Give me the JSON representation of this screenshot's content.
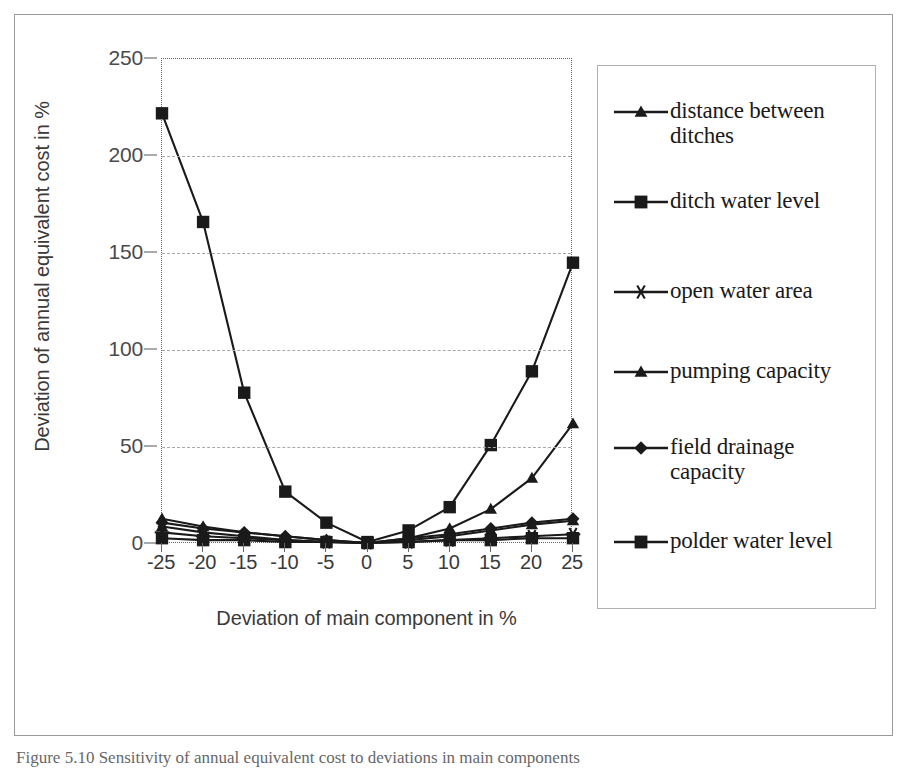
{
  "chart_data": {
    "type": "line",
    "title": "",
    "xlabel": "Deviation of main component in %",
    "ylabel": "Deviation of annual equivalent cost in %",
    "x": [
      -25,
      -20,
      -15,
      -10,
      -5,
      0,
      5,
      10,
      15,
      20,
      25
    ],
    "xtick_labels": [
      "-25",
      "-20",
      "-15",
      "-10",
      "-5",
      "0",
      "5",
      "10",
      "15",
      "20",
      "25"
    ],
    "ytick_labels": [
      "0",
      "50",
      "100",
      "150",
      "200",
      "250"
    ],
    "yticks": [
      0,
      50,
      100,
      150,
      200,
      250
    ],
    "ylim": [
      0,
      250
    ],
    "xlim": [
      -25,
      25
    ],
    "grid": "horizontal-dashed",
    "legend_position": "right",
    "series": [
      {
        "name": "distance between ditches",
        "marker": "triangle",
        "values": [
          13,
          9,
          6,
          4,
          2,
          0.5,
          2,
          4,
          7,
          10,
          12
        ]
      },
      {
        "name": "ditch water level",
        "marker": "square",
        "values": [
          222,
          166,
          78,
          27,
          11,
          1,
          7,
          19,
          51,
          89,
          145
        ]
      },
      {
        "name": "open water area",
        "marker": "asterisk",
        "values": [
          6,
          4,
          3,
          2,
          1,
          0.5,
          1,
          2,
          3,
          4,
          5
        ]
      },
      {
        "name": "pumping capacity",
        "marker": "triangle",
        "values": [
          9,
          6,
          4,
          2,
          1,
          0.5,
          3,
          8,
          18,
          34,
          62
        ]
      },
      {
        "name": "field drainage capacity",
        "marker": "diamond",
        "values": [
          11,
          8,
          6,
          4,
          2,
          0.5,
          3,
          5,
          8,
          11,
          13
        ]
      },
      {
        "name": "polder water level",
        "marker": "square",
        "values": [
          3,
          2,
          2,
          1,
          1,
          0.5,
          1,
          2,
          2,
          3,
          3
        ]
      }
    ]
  },
  "legend": {
    "items": [
      {
        "label": "distance between ditches",
        "marker": "triangle"
      },
      {
        "label": "ditch water level",
        "marker": "square"
      },
      {
        "label": "open water area",
        "marker": "asterisk"
      },
      {
        "label": "pumping capacity",
        "marker": "triangle"
      },
      {
        "label": "field drainage capacity",
        "marker": "diamond"
      },
      {
        "label": "polder water level",
        "marker": "square"
      }
    ]
  },
  "caption": {
    "text": "Figure 5.10 Sensitivity of annual equivalent cost to deviations in main components"
  },
  "colors": {
    "line": "#1a1a1a",
    "grid": "#a8a8a8",
    "axis_text": "#3a3a3a",
    "frame": "#9a9a9a"
  }
}
